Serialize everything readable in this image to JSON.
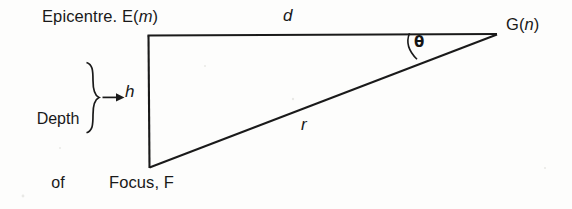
{
  "figure": {
    "kind": "geometry-diagram",
    "background_color": "#fefefe",
    "line_color": "#1a1a1a"
  },
  "labels": {
    "epicentre_prefix": "Epicentre. E(",
    "epicentre_var": "m",
    "epicentre_suffix": ")",
    "focus": "Focus, F",
    "station_prefix": "G(",
    "station_var": "n",
    "station_suffix": ")",
    "side_d": "d",
    "side_r": "r",
    "side_h": "h",
    "angle_theta": "θ",
    "depth_line_1": "Depth",
    "depth_line_2": "of",
    "depth_line_3": "focus"
  },
  "geometry": {
    "vertex_epicentre": {
      "name": "E",
      "x": 148,
      "y": 36
    },
    "vertex_focus": {
      "name": "F",
      "x": 149,
      "y": 168
    },
    "vertex_station": {
      "name": "G",
      "x": 497,
      "y": 34
    },
    "side_d_label_pos": {
      "x": 285,
      "y": 14
    },
    "side_r_label_pos": {
      "x": 303,
      "y": 123
    },
    "side_h_label_pos": {
      "x": 128,
      "y": 90
    },
    "theta_label_pos": {
      "x": 419,
      "y": 41
    },
    "theta_arc_start": {
      "x": 409,
      "y": 32
    },
    "theta_arc_end": {
      "x": 418,
      "y": 59
    },
    "arrow_tail": {
      "x": 106,
      "y": 97
    },
    "arrow_head": {
      "x": 124,
      "y": 97
    },
    "brace_x": 92,
    "brace_top": 62,
    "brace_bottom": 134
  }
}
